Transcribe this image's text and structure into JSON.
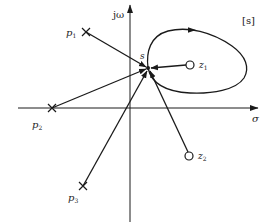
{
  "diagram": {
    "plane_label": "[s]",
    "axes": {
      "imag_label": "jω",
      "real_label": "σ"
    },
    "point_s": {
      "label": "s"
    },
    "poles": [
      {
        "name": "p",
        "sub": "1"
      },
      {
        "name": "p",
        "sub": "2"
      },
      {
        "name": "p",
        "sub": "3"
      }
    ],
    "zeros": [
      {
        "name": "z",
        "sub": "1"
      },
      {
        "name": "z",
        "sub": "2"
      }
    ],
    "colors": {
      "stroke": "#1a1a1a",
      "background": "#ffffff"
    }
  }
}
